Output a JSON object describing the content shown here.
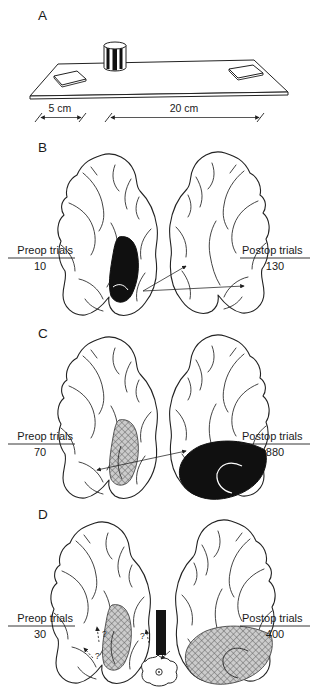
{
  "panelA": {
    "letter": "A",
    "dim_small": "5 cm",
    "dim_large": "20 cm",
    "apparatus": {
      "board": "test-board",
      "left_well": "food-well-left",
      "right_well": "food-well-right",
      "cylinder": "striped-cylinder"
    }
  },
  "panelB": {
    "letter": "B",
    "preop_label": "Preop trials",
    "preop_value": "10",
    "postop_label": "Postop trials",
    "postop_value": "130",
    "left_lesion": "solid-black",
    "right_lesion": "none"
  },
  "panelC": {
    "letter": "C",
    "preop_label": "Preop trials",
    "preop_value": "70",
    "postop_label": "Postop trials",
    "postop_value": "880",
    "left_lesion": "hatched",
    "right_lesion": "solid-black"
  },
  "panelD": {
    "letter": "D",
    "preop_label": "Preop trials",
    "preop_value": "30",
    "postop_label": "Postop trials",
    "postop_value": "400",
    "left_lesion": "hatched",
    "right_lesion": "hatched",
    "q_left_upper": "?",
    "q_left_lower": "?",
    "q_center": "?"
  },
  "colors": {
    "paper": "#ffffff",
    "ink": "#1f1f1f",
    "lesion_black": "#101010",
    "hatch_bg": "#cccccc",
    "hatch_line": "#5f5f5f"
  }
}
